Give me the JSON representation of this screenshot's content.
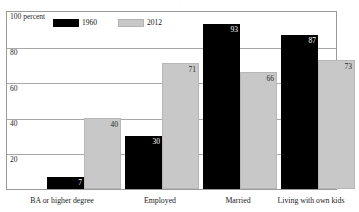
{
  "title_remnant": "Characteristics of young adults, 1960 and 2012 (percent of ages 18–31)",
  "chart_data": {
    "type": "bar",
    "title": "",
    "xlabel": "",
    "ylabel": "100 percent",
    "ylim": [
      0,
      100
    ],
    "grid": true,
    "legend_position": "top-left",
    "categories": [
      "BA or higher degree",
      "Employed",
      "Married",
      "Living with own kids"
    ],
    "series": [
      {
        "name": "1960",
        "color": "#000000",
        "values": [
          7,
          30,
          93,
          87
        ]
      },
      {
        "name": "2012",
        "color": "#c8c8c8",
        "values": [
          40,
          71,
          66,
          73
        ]
      }
    ],
    "yticks": [
      {
        "value": 100,
        "label": "100 percent"
      },
      {
        "value": 80,
        "label": "80"
      },
      {
        "value": 60,
        "label": "60"
      },
      {
        "value": 40,
        "label": "40"
      },
      {
        "value": 20,
        "label": "20"
      }
    ]
  }
}
